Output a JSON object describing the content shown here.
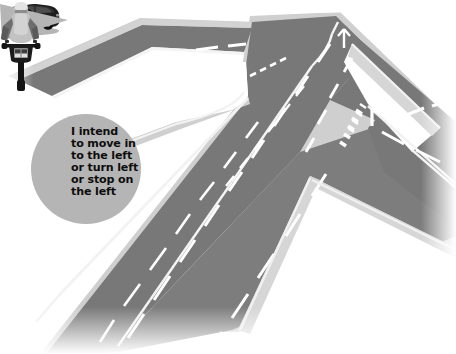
{
  "illustration": {
    "title": "Motorcyclist left-turn arm signal at a road junction",
    "type": "road-safety-diagram",
    "view": "aerial-perspective"
  },
  "speech_bubble": {
    "name": "rider-intention-bubble",
    "shape": "circle",
    "fill_color": "#b5b5b5",
    "text_color": "#0d0d0d",
    "tail_direction": "right",
    "lines": [
      "I intend",
      "to move in",
      "to the left",
      "or turn left",
      "or stop on",
      "the left"
    ],
    "full_text": "I intend to move in to the left or turn left or stop on the left"
  },
  "rider_icon": {
    "name": "motorcyclist-rear-view-icon",
    "description": "Rear view of helmeted motorcyclist with left arm extended outward signalling",
    "helmet_color": "#d8d8d8",
    "body_color": "#c6c6c6",
    "arm_color": "#6a6a6a",
    "bike_color": "#1a1a1a"
  },
  "vehicles": [
    {
      "name": "car",
      "label": "car",
      "color": "#1d1d1d",
      "position": "main-road-upper",
      "heading": "toward-junction"
    },
    {
      "name": "motorcycle",
      "label": "motorcycle",
      "color": "#151515",
      "rider_jacket_color": "#e8e8e8",
      "position": "main-road-lower-left-lane",
      "heading": "up-road"
    }
  ],
  "roads": {
    "surface_color": "#787878",
    "surface_color_dark": "#6d6d6d",
    "verge_color": "#d0d0d0",
    "marking_color": "#ffffff",
    "segments": [
      {
        "name": "main-road",
        "orientation": "diagonal-top-right-to-bottom-left",
        "lanes": 4
      },
      {
        "name": "side-road-left",
        "orientation": "from-left-edge",
        "lanes": 2
      },
      {
        "name": "side-road-right",
        "orientation": "to-right-edge",
        "lanes": 2
      }
    ],
    "markings": [
      {
        "name": "centre-line",
        "style": "long-dashes"
      },
      {
        "name": "lane-divider",
        "style": "short-dashes"
      },
      {
        "name": "edge-line",
        "style": "solid"
      },
      {
        "name": "give-way-line",
        "style": "double-dashed-block"
      },
      {
        "name": "stop-bar",
        "style": "solid-transverse"
      },
      {
        "name": "hatched-island",
        "style": "chevron-hatching"
      }
    ]
  },
  "background": {
    "color": "#ffffff"
  }
}
